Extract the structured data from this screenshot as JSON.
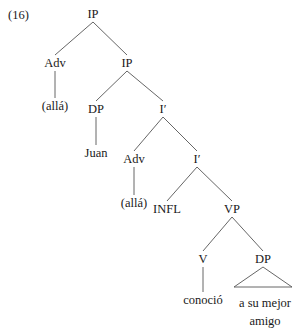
{
  "figure": {
    "example_number": "(16)",
    "kind": "syntax-tree"
  },
  "nodes": [
    {
      "id": "ip-top",
      "label": "IP",
      "x": 93,
      "y": 8,
      "type": "phrase"
    },
    {
      "id": "adv-1",
      "label": "Adv",
      "x": 55,
      "y": 57,
      "type": "phrase"
    },
    {
      "id": "ip-2",
      "label": "IP",
      "x": 127,
      "y": 57,
      "type": "phrase"
    },
    {
      "id": "alla-1",
      "label": "(allá)",
      "x": 55,
      "y": 100,
      "type": "terminal"
    },
    {
      "id": "dp-1",
      "label": "DP",
      "x": 96,
      "y": 103,
      "type": "phrase"
    },
    {
      "id": "ibar-1",
      "label": "I′",
      "x": 163,
      "y": 103,
      "type": "bar"
    },
    {
      "id": "juan",
      "label": "Juan",
      "x": 96,
      "y": 147,
      "type": "terminal"
    },
    {
      "id": "adv-2",
      "label": "Adv",
      "x": 134,
      "y": 153,
      "type": "phrase"
    },
    {
      "id": "ibar-2",
      "label": "I′",
      "x": 197,
      "y": 153,
      "type": "bar"
    },
    {
      "id": "alla-2",
      "label": "(allá)",
      "x": 134,
      "y": 197,
      "type": "terminal"
    },
    {
      "id": "infl",
      "label": "INFL",
      "x": 167,
      "y": 203,
      "type": "head"
    },
    {
      "id": "vp",
      "label": "VP",
      "x": 232,
      "y": 203,
      "type": "phrase"
    },
    {
      "id": "v",
      "label": "V",
      "x": 203,
      "y": 253,
      "type": "head"
    },
    {
      "id": "dp-2",
      "label": "DP",
      "x": 263,
      "y": 253,
      "type": "phrase"
    },
    {
      "id": "conocio",
      "label": "conoció",
      "x": 203,
      "y": 294,
      "type": "terminal"
    },
    {
      "id": "amigo",
      "label": "a su mejor amigo",
      "x": 265,
      "y": 294,
      "type": "terminal-wrapped"
    }
  ],
  "edges": [
    {
      "from": "ip-top",
      "to": "adv-1"
    },
    {
      "from": "ip-top",
      "to": "ip-2"
    },
    {
      "from": "adv-1",
      "to": "alla-1"
    },
    {
      "from": "ip-2",
      "to": "dp-1"
    },
    {
      "from": "ip-2",
      "to": "ibar-1"
    },
    {
      "from": "dp-1",
      "to": "juan"
    },
    {
      "from": "ibar-1",
      "to": "adv-2"
    },
    {
      "from": "ibar-1",
      "to": "ibar-2"
    },
    {
      "from": "adv-2",
      "to": "alla-2"
    },
    {
      "from": "ibar-2",
      "to": "infl"
    },
    {
      "from": "ibar-2",
      "to": "vp"
    },
    {
      "from": "vp",
      "to": "v"
    },
    {
      "from": "vp",
      "to": "dp-2"
    },
    {
      "from": "v",
      "to": "conocio"
    }
  ],
  "triangle": {
    "parent": "dp-2",
    "apex_x": 263,
    "apex_y": 267,
    "left_x": 234,
    "right_x": 292,
    "base_y": 287
  },
  "style": {
    "line_color": "#555555",
    "text_color": "#1a1a1a",
    "background": "#ffffff"
  }
}
